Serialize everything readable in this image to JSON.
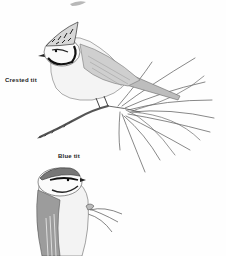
{
  "illustration": {
    "background_color": "#ffffff",
    "ink_color": "#2a2a2a",
    "captions": [
      {
        "id": "crested",
        "label": "Crested tit"
      },
      {
        "id": "blue",
        "label": "Blue tit"
      }
    ],
    "subjects": [
      {
        "name": "crested-tit",
        "pose": "perched on pine branch, facing left",
        "caption": "Crested tit"
      },
      {
        "name": "blue-tit",
        "pose": "perched on twig, facing right, partial view",
        "caption": "Blue tit"
      }
    ]
  }
}
